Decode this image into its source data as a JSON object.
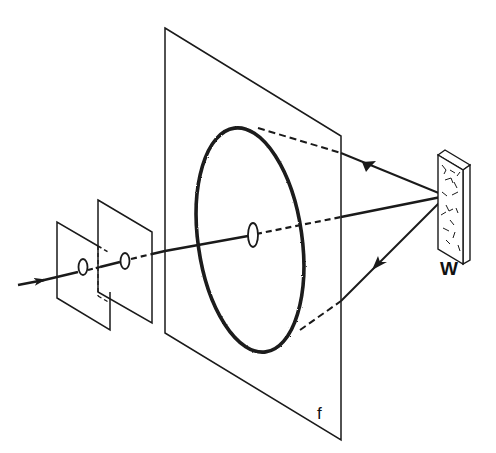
{
  "diagram": {
    "type": "optical-setup",
    "labels": {
      "sample": "W",
      "film": "f"
    },
    "components": [
      {
        "name": "incident-beam",
        "kind": "arrow"
      },
      {
        "name": "aperture-screen-1",
        "kind": "plane-with-hole"
      },
      {
        "name": "aperture-screen-2",
        "kind": "plane-with-hole"
      },
      {
        "name": "film-plane",
        "kind": "plane-with-hole",
        "label": "f"
      },
      {
        "name": "diffraction-ring",
        "kind": "ellipse"
      },
      {
        "name": "sample",
        "kind": "block",
        "label": "W"
      },
      {
        "name": "diffracted-ray-upper",
        "kind": "arrow"
      },
      {
        "name": "diffracted-ray-lower",
        "kind": "arrow"
      }
    ],
    "colors": {
      "stroke": "#1a1a1a",
      "background": "#ffffff"
    }
  }
}
